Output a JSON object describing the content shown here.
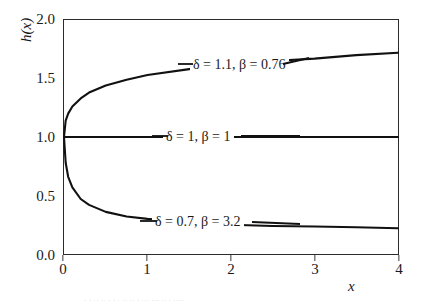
{
  "chart_data": {
    "type": "line",
    "title": "",
    "xlabel": "x",
    "ylabel": "h(x)",
    "xlim": [
      0,
      4
    ],
    "ylim": [
      0.0,
      2.0
    ],
    "grid": false,
    "legend_position": "inline-annotations",
    "x_ticks": [
      "0",
      "1",
      "2",
      "3",
      "4"
    ],
    "x_tick_values": [
      0,
      1,
      2,
      3,
      4
    ],
    "y_ticks": [
      "0.0",
      "0.5",
      "1.0",
      "1.5",
      "2.0"
    ],
    "y_tick_values": [
      0.0,
      0.5,
      1.0,
      1.5,
      2.0
    ],
    "series": [
      {
        "name": "delta = 1.1, beta = 0.76",
        "label": "δ = 1.1, β = 0.76",
        "delta": 1.1,
        "beta": 0.76,
        "x": [
          0,
          0.02,
          0.05,
          0.1,
          0.2,
          0.3,
          0.5,
          0.75,
          1.0,
          1.5,
          2.0,
          2.5,
          3.0,
          3.5,
          4.0
        ],
        "values": [
          1.0,
          1.14,
          1.2,
          1.26,
          1.33,
          1.38,
          1.44,
          1.49,
          1.53,
          1.58,
          1.62,
          1.65,
          1.67,
          1.7,
          1.72
        ]
      },
      {
        "name": "delta = 1, beta = 1",
        "label": "δ = 1, β = 1",
        "delta": 1,
        "beta": 1,
        "x": [
          0,
          1,
          2,
          3,
          4
        ],
        "values": [
          1.0,
          1.0,
          1.0,
          1.0,
          1.0
        ]
      },
      {
        "name": "delta = 0.7, beta = 3.2",
        "label": "δ = 0.7, β = 3.2",
        "delta": 0.7,
        "beta": 3.2,
        "x": [
          0,
          0.02,
          0.05,
          0.1,
          0.2,
          0.3,
          0.5,
          0.75,
          1.0,
          1.5,
          2.0,
          2.5,
          3.0,
          3.5,
          4.0
        ],
        "values": [
          1.0,
          0.78,
          0.66,
          0.57,
          0.47,
          0.42,
          0.36,
          0.32,
          0.3,
          0.27,
          0.25,
          0.24,
          0.235,
          0.228,
          0.22
        ]
      }
    ],
    "annotations": [
      {
        "text": "δ = 1.1, β = 0.76",
        "x": 1.55,
        "y": 1.52
      },
      {
        "text": "δ = 1, β = 1",
        "x": 1.25,
        "y": 1.0
      },
      {
        "text": "δ = 0.7, β = 3.2",
        "x": 1.25,
        "y": 0.3
      }
    ],
    "colors": {
      "curve": "#111111",
      "axis": "#2b2b2b",
      "background": "#ffffff",
      "text": "#1a1a1a"
    }
  },
  "caption": {
    "clipped_text": "· · ·· ·· · · · ·· ·· · ··· ··· ·· · ····"
  }
}
